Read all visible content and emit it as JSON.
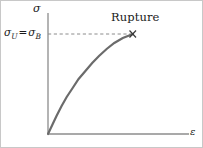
{
  "figure": {
    "background_color": "#ffffff",
    "border_color": "#c8c8c8"
  },
  "chart_data": {
    "type": "line",
    "title": "",
    "subtitle": "",
    "xlabel": "ε",
    "ylabel": "σ",
    "grid": false,
    "legend": null,
    "axis_color": "#8c8c8c",
    "curve_color": "#6b6b6b",
    "dashed_color": "#8c8c8c",
    "xlim": [
      0,
      1
    ],
    "ylim": [
      0,
      1
    ],
    "axis_ticks": {
      "x": [],
      "y": []
    },
    "series": [
      {
        "name": "stress-strain curve",
        "comment": "concave-down tensile stress-strain curve from origin to rupture",
        "x": [
          0.0,
          0.05,
          0.1,
          0.16,
          0.22,
          0.29,
          0.36,
          0.44,
          0.52,
          0.6,
          0.69,
          0.78,
          0.88,
          1.0
        ],
        "y": [
          0.0,
          0.09,
          0.18,
          0.28,
          0.37,
          0.46,
          0.55,
          0.63,
          0.71,
          0.78,
          0.85,
          0.91,
          0.96,
          1.0
        ]
      }
    ],
    "annotations": [
      {
        "name": "rupture",
        "text": "Rupture",
        "marker": "×",
        "x": 1.0,
        "y": 1.0
      },
      {
        "name": "ultimate-stress-level",
        "text": "σ_U = σ_B",
        "y": 1.0,
        "style": "dashed-horizontal-leader"
      }
    ]
  },
  "labels": {
    "y_axis": "σ",
    "x_axis": "ε",
    "rupture": "Rupture",
    "ultimate_stress": {
      "symbol_1": "σ",
      "sub_1": "U",
      "equals": "=",
      "symbol_2": "σ",
      "sub_2": "B"
    }
  }
}
